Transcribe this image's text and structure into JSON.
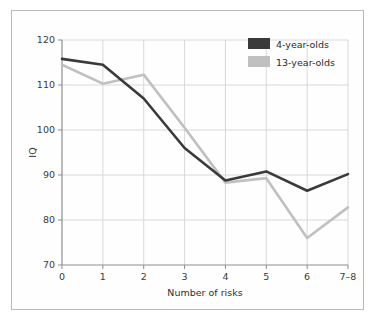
{
  "figure": {
    "background_color": "#ffffff",
    "border_color": "#b9b9b9",
    "plot_background_color": "#fefefe"
  },
  "chart_data": {
    "type": "line",
    "title": "",
    "subtitle": "",
    "xlabel": "Number of risks",
    "ylabel": "IQ",
    "categories": [
      "0",
      "1",
      "2",
      "3",
      "4",
      "5",
      "6",
      "7–8"
    ],
    "xtick_labels": [
      "0",
      "1",
      "2",
      "3",
      "4",
      "5",
      "6",
      "7–8"
    ],
    "ytick_labels": [
      "70",
      "80",
      "90",
      "100",
      "110",
      "120"
    ],
    "ylim": [
      70,
      120
    ],
    "ytick_step": 10,
    "grid": true,
    "grid_color": "#d8d8d8",
    "legend_position": "top-right",
    "series": [
      {
        "name": "4-year-olds",
        "color": "#3a3a3a",
        "values": [
          115.8,
          114.5,
          107.0,
          96.0,
          88.8,
          90.8,
          86.5,
          90.2
        ]
      },
      {
        "name": "13-year-olds",
        "color": "#c0c0c0",
        "values": [
          114.5,
          110.3,
          112.3,
          100.5,
          88.3,
          89.3,
          76.0,
          82.8
        ]
      }
    ],
    "annotations": []
  },
  "legend": {
    "entries": [
      {
        "label": "4-year-olds",
        "color": "#3a3a3a"
      },
      {
        "label": "13-year-olds",
        "color": "#c0c0c0"
      }
    ]
  }
}
